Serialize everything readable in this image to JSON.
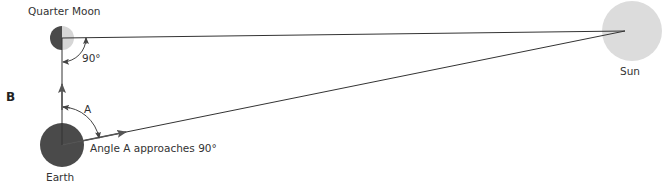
{
  "panel_label": "B",
  "bodies": {
    "moon": {
      "label": "Quarter Moon",
      "dark_color": "#4a4a4a",
      "light_color": "#d6d6d6"
    },
    "earth": {
      "label": "Earth",
      "color": "#4a4a4a"
    },
    "sun": {
      "label": "Sun",
      "color": "#dcdcdc"
    }
  },
  "angles": {
    "moon_angle": "90°",
    "earth_angle": "A"
  },
  "caption": "Angle A approaches 90°",
  "colors": {
    "line": "#333333",
    "text": "#333333"
  }
}
